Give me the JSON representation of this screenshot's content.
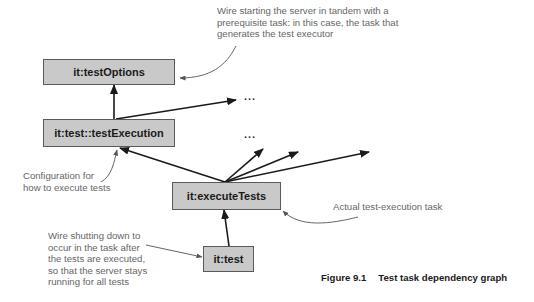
{
  "nodes": {
    "test_options": "it:testOptions",
    "test_execution": "it:test::testExecution",
    "execute_tests": "it:executeTests",
    "test": "it:test"
  },
  "ellipsis": {
    "upper": "...",
    "lower": "..."
  },
  "annotations": {
    "test_options_note": [
      "Wire starting the server in tandem with a",
      "prerequisite task: in this case, the task that",
      "generates the test executor"
    ],
    "configuration_note": [
      "Configuration for",
      "how to execute tests"
    ],
    "execute_tests_note": [
      "Actual test-execution task"
    ],
    "test_note": [
      "Wire shutting down to",
      "occur in the task after",
      "the tests are executed,",
      "so that the server stays",
      "running for all tests"
    ]
  },
  "caption": {
    "number": "Figure 9.1",
    "title": "Test task dependency graph"
  },
  "colors": {
    "box_fill": "#c9c9c9",
    "box_border": "#5a5a5a",
    "arrow": "#1a1a1a",
    "annotation_text": "#666666"
  }
}
